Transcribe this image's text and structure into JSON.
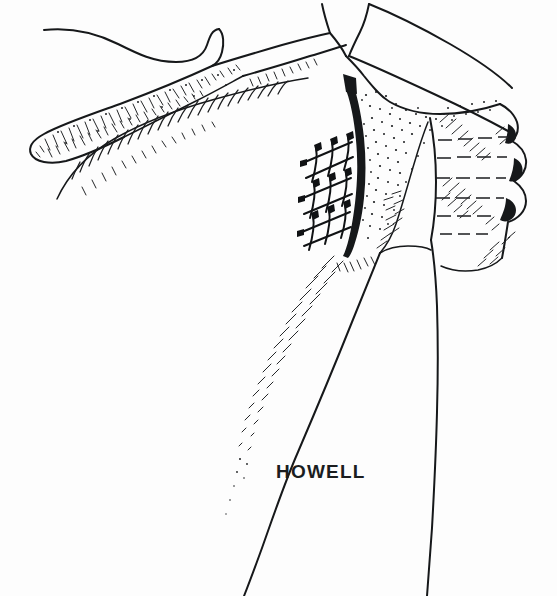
{
  "figure": {
    "medium": "pen-and-ink line art",
    "background_color": "#fdfdfd",
    "ink_color": "#16181a",
    "canvas": {
      "width": 557,
      "height": 596
    }
  },
  "signature": {
    "text": "HOWELL",
    "style": "hand-lettered capitals",
    "x": 276,
    "y": 478
  },
  "structures": [
    {
      "id": "acromion",
      "label": "Acromion",
      "region": "upper-left"
    },
    {
      "id": "clavicle",
      "label": "Clavicle",
      "region": "upper-left-band"
    },
    {
      "id": "scapular-spine",
      "label": "Scapular spine",
      "region": "upper-left"
    },
    {
      "id": "coracoid",
      "label": "Coracoid process",
      "region": "top-center"
    },
    {
      "id": "glenoid",
      "label": "Glenoid fossa",
      "region": "center"
    },
    {
      "id": "glenoid-rim",
      "label": "Glenoid rim",
      "region": "center-line"
    },
    {
      "id": "humeral-head",
      "label": "Humeral head",
      "region": "right"
    },
    {
      "id": "greater-tuberosity",
      "label": "Greater tuberosity facets",
      "region": "right-edge"
    },
    {
      "id": "humeral-shaft",
      "label": "Humeral shaft",
      "region": "lower-center"
    },
    {
      "id": "suture-repair",
      "label": "Suture anchor lattice repair",
      "region": "center-left"
    }
  ],
  "annotations": {
    "suture_rows": 3,
    "suture_knots_per_row": 4,
    "tuberosity_bumps": 3,
    "contour_dash_lines": 6
  },
  "colors": {
    "ink": "#16181a",
    "hatch": "#1b1d1f",
    "paper": "#fdfdfd"
  }
}
